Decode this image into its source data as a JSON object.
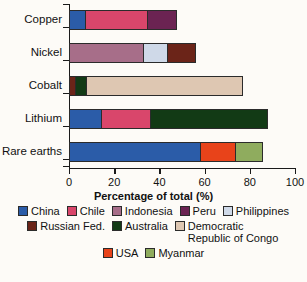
{
  "chart_data": {
    "type": "bar",
    "orientation": "horizontal",
    "stacked": true,
    "title": "",
    "xlabel": "Percentage of total (%)",
    "ylabel": "",
    "xlim": [
      0,
      100
    ],
    "xticks": [
      0,
      20,
      40,
      60,
      80,
      100
    ],
    "categories": [
      "Copper",
      "Nickel",
      "Cobalt",
      "Lithium",
      "Rare earths"
    ],
    "grid": false,
    "legend_position": "bottom",
    "series": [
      {
        "name": "China",
        "color": "#2B5CA8",
        "values": [
          7.5,
          0,
          0,
          14.5,
          58.5
        ]
      },
      {
        "name": "Chile",
        "color": "#D9466B",
        "values": [
          27.5,
          0,
          0,
          22,
          0
        ]
      },
      {
        "name": "Indonesia",
        "color": "#A76E89",
        "values": [
          0,
          33,
          0,
          0,
          0
        ]
      },
      {
        "name": "Peru",
        "color": "#6B2352",
        "values": [
          13,
          0,
          0,
          0,
          0
        ]
      },
      {
        "name": "Philippines",
        "color": "#CFD9E8",
        "values": [
          0,
          11,
          0,
          0,
          0
        ]
      },
      {
        "name": "Russian Fed.",
        "color": "#6B2418",
        "values": [
          0,
          12,
          3,
          0,
          0
        ]
      },
      {
        "name": "Australia",
        "color": "#123A15",
        "values": [
          0,
          0,
          5,
          51.5,
          0
        ]
      },
      {
        "name": "Democratic Republic of Congo",
        "color": "#DEC7B2",
        "values": [
          0,
          0,
          69,
          0,
          0
        ]
      },
      {
        "name": "USA",
        "color": "#E8431A",
        "values": [
          0,
          0,
          0,
          0,
          15.5
        ]
      },
      {
        "name": "Myanmar",
        "color": "#8FAC5E",
        "values": [
          0,
          0,
          0,
          0,
          12
        ]
      }
    ],
    "bar_totals": [
      48,
      56,
      77,
      88,
      86
    ],
    "stacks": [
      {
        "category": "Copper",
        "segments": [
          {
            "name": "China",
            "value": 7.5
          },
          {
            "name": "Chile",
            "value": 27.5
          },
          {
            "name": "Peru",
            "value": 13
          }
        ]
      },
      {
        "category": "Nickel",
        "segments": [
          {
            "name": "Indonesia",
            "value": 33
          },
          {
            "name": "Philippines",
            "value": 11
          },
          {
            "name": "Russian Fed.",
            "value": 12
          }
        ]
      },
      {
        "category": "Cobalt",
        "segments": [
          {
            "name": "Russian Fed.",
            "value": 3
          },
          {
            "name": "Australia",
            "value": 5
          },
          {
            "name": "Democratic Republic of Congo",
            "value": 69
          }
        ]
      },
      {
        "category": "Lithium",
        "segments": [
          {
            "name": "China",
            "value": 14.5
          },
          {
            "name": "Chile",
            "value": 22
          },
          {
            "name": "Australia",
            "value": 51.5
          }
        ]
      },
      {
        "category": "Rare earths",
        "segments": [
          {
            "name": "China",
            "value": 58.5
          },
          {
            "name": "USA",
            "value": 15.5
          },
          {
            "name": "Myanmar",
            "value": 51.5
          }
        ]
      }
    ],
    "legend_rows": [
      [
        {
          "label": "China",
          "color": "#2B5CA8"
        },
        {
          "label": "Chile",
          "color": "#D9466B"
        },
        {
          "label": "Indonesia",
          "color": "#A76E89"
        },
        {
          "label": "Peru",
          "color": "#6B2352"
        },
        {
          "label": "Philippines",
          "color": "#CFD9E8"
        }
      ],
      [
        {
          "label": "Russian Fed.",
          "color": "#6B2418"
        },
        {
          "label": "Australia",
          "color": "#123A15"
        },
        {
          "label": "Democratic Republic of Congo",
          "color": "#DEC7B2",
          "wrap": true
        }
      ],
      [
        {
          "label": "USA",
          "color": "#E8431A"
        },
        {
          "label": "Myanmar",
          "color": "#8FAC5E"
        }
      ]
    ]
  }
}
